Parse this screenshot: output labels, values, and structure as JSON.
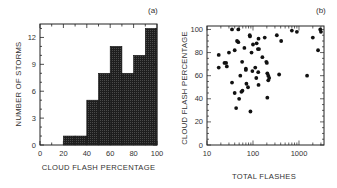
{
  "chart_data": [
    {
      "type": "bar",
      "panel_label": "(a)",
      "title": "",
      "xlabel": "CLOUD FLASH PERCENTAGE",
      "ylabel": "NUMBER OF STORMS",
      "bin_edges": [
        0,
        10,
        20,
        30,
        40,
        50,
        60,
        70,
        80,
        90,
        100
      ],
      "categories": [
        "0-10",
        "10-20",
        "20-30",
        "30-40",
        "40-50",
        "50-60",
        "60-70",
        "70-80",
        "80-90",
        "90-100"
      ],
      "values": [
        0,
        0,
        1,
        1,
        5,
        8,
        11,
        8,
        10,
        13
      ],
      "xlim": [
        0,
        100
      ],
      "ylim": [
        0,
        13.5
      ],
      "xticks": [
        0,
        20,
        40,
        60,
        80,
        100
      ],
      "yticks": [
        0,
        3,
        6,
        9,
        12
      ],
      "grid": false,
      "bar_fill": "dark stippled"
    },
    {
      "type": "scatter",
      "panel_label": "(b)",
      "title": "",
      "xlabel": "TOTAL FLASHES",
      "ylabel": "CLOUD FLASH PERCENTAGE",
      "xscale": "log",
      "xlim": [
        10,
        3500
      ],
      "ylim": [
        0,
        103
      ],
      "xticks": [
        10,
        100,
        1000
      ],
      "yticks": [
        0,
        20,
        40,
        60,
        80,
        100
      ],
      "grid": false,
      "points": [
        [
          18,
          78
        ],
        [
          18,
          67
        ],
        [
          24,
          71
        ],
        [
          26,
          71
        ],
        [
          27,
          68
        ],
        [
          30,
          80
        ],
        [
          35,
          100
        ],
        [
          35,
          54
        ],
        [
          40,
          82
        ],
        [
          40,
          45
        ],
        [
          43,
          32
        ],
        [
          45,
          90
        ],
        [
          48,
          89
        ],
        [
          48,
          100
        ],
        [
          50,
          40
        ],
        [
          53,
          60
        ],
        [
          56,
          46
        ],
        [
          59,
          47
        ],
        [
          58,
          72
        ],
        [
          65,
          84
        ],
        [
          70,
          66
        ],
        [
          70,
          65
        ],
        [
          72,
          53
        ],
        [
          78,
          50
        ],
        [
          85,
          95
        ],
        [
          86,
          94
        ],
        [
          88,
          29
        ],
        [
          93,
          80
        ],
        [
          100,
          87
        ],
        [
          97,
          64
        ],
        [
          112,
          67
        ],
        [
          118,
          58
        ],
        [
          120,
          88
        ],
        [
          128,
          83
        ],
        [
          135,
          83
        ],
        [
          132,
          92
        ],
        [
          132,
          52
        ],
        [
          130,
          63
        ],
        [
          160,
          76
        ],
        [
          180,
          93
        ],
        [
          195,
          72
        ],
        [
          200,
          71
        ],
        [
          205,
          62
        ],
        [
          215,
          60
        ],
        [
          225,
          58
        ],
        [
          215,
          56
        ],
        [
          205,
          41
        ],
        [
          330,
          95
        ],
        [
          370,
          61
        ],
        [
          410,
          90
        ],
        [
          700,
          99
        ],
        [
          900,
          98
        ],
        [
          1500,
          60
        ],
        [
          2000,
          93
        ],
        [
          2600,
          82
        ],
        [
          3000,
          98
        ],
        [
          2900,
          100
        ]
      ]
    }
  ],
  "panels": {
    "a": {
      "label": "(a)",
      "xlabel": "CLOUD FLASH PERCENTAGE",
      "ylabel": "NUMBER OF STORMS",
      "xtick_labels": [
        "0",
        "20",
        "40",
        "60",
        "80",
        "100"
      ],
      "ytick_labels": [
        "0",
        "3",
        "6",
        "9",
        "12"
      ]
    },
    "b": {
      "label": "(b)",
      "xlabel": "TOTAL FLASHES",
      "ylabel": "CLOUD FLASH PERCENTAGE",
      "xtick_labels": [
        "10",
        "100",
        "1000"
      ],
      "ytick_labels": [
        "0",
        "20",
        "40",
        "60",
        "80",
        "100"
      ]
    }
  },
  "colors": {
    "bar": "#2a2a2a",
    "axis": "#222222",
    "marker": "#111111"
  }
}
